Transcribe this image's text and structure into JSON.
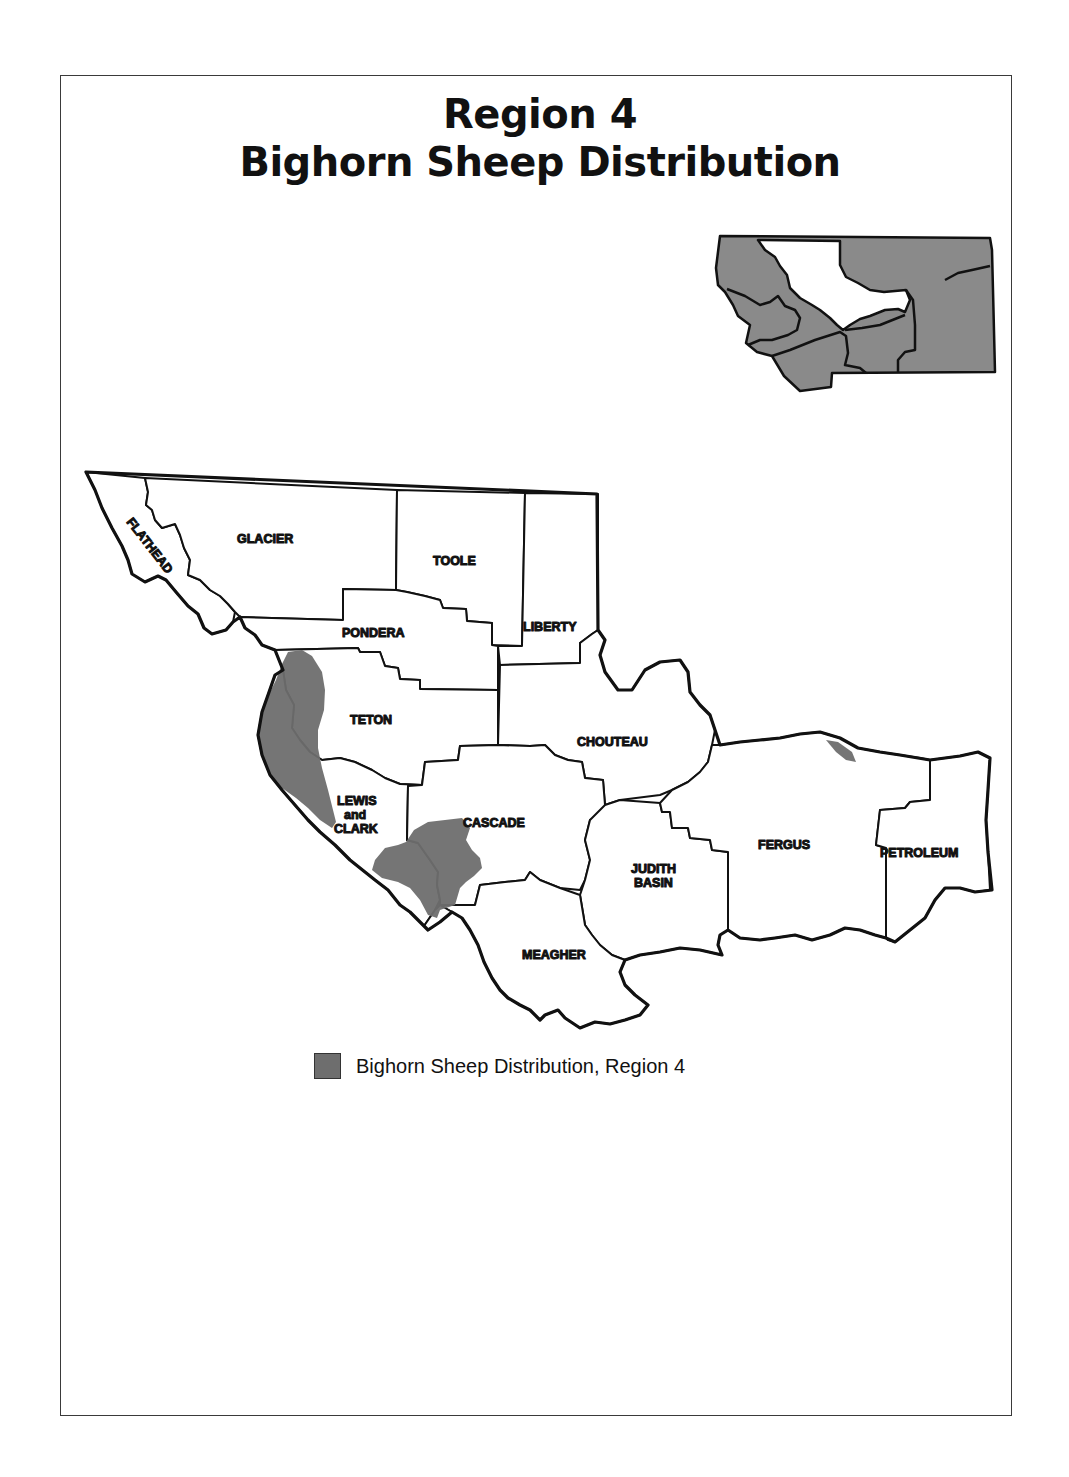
{
  "title": {
    "line1": "Region 4",
    "line2": "Bighorn Sheep Distribution"
  },
  "inset_map": {
    "subject": "Montana",
    "highlighted_region": "Region 4",
    "highlight_fill": "#ffffff",
    "other_regions_fill": "#8a8a8a"
  },
  "counties": [
    {
      "id": "flathead",
      "label": "FLATHEAD"
    },
    {
      "id": "glacier",
      "label": "GLACIER"
    },
    {
      "id": "toole",
      "label": "TOOLE"
    },
    {
      "id": "liberty",
      "label": "LIBERTY"
    },
    {
      "id": "pondera",
      "label": "PONDERA"
    },
    {
      "id": "teton",
      "label": "TETON"
    },
    {
      "id": "chouteau",
      "label": "CHOUTEAU"
    },
    {
      "id": "lewis_and_clark",
      "label_lines": [
        "LEWIS",
        "and",
        "CLARK"
      ]
    },
    {
      "id": "cascade",
      "label": "CASCADE"
    },
    {
      "id": "judith_basin",
      "label_lines": [
        "JUDITH",
        "BASIN"
      ]
    },
    {
      "id": "fergus",
      "label": "FERGUS"
    },
    {
      "id": "petroleum",
      "label": "PETROLEUM"
    },
    {
      "id": "meagher",
      "label": "MEAGHER"
    }
  ],
  "colors": {
    "distribution_fill": "#6e6e6e",
    "boundary_stroke": "#111111",
    "background": "#ffffff"
  },
  "legend": {
    "label": "Bighorn Sheep Distribution, Region 4",
    "swatch_color": "#6e6e6e"
  }
}
